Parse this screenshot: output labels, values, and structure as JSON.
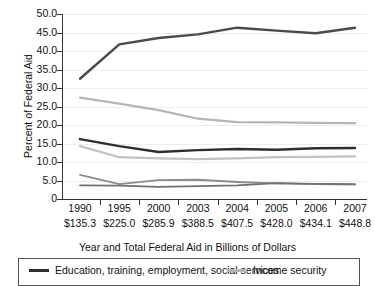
{
  "chart_data": {
    "type": "line",
    "title": "",
    "xlabel": "Year and Total Federal Aid in Billions of Dollars",
    "ylabel": "Percent of Federal Aid",
    "categories": [
      "1990",
      "1995",
      "2000",
      "2003",
      "2004",
      "2005",
      "2006",
      "2007"
    ],
    "x_sublabels": [
      "$135.3",
      "$225.0",
      "$285.9",
      "$388.5",
      "$407.5",
      "$428.0",
      "$434.1",
      "$448.8"
    ],
    "ylim": [
      0,
      50
    ],
    "yticks": [
      "0",
      "5.0",
      "10.0",
      "15.0",
      "20.0",
      "25.0",
      "30.0",
      "35.0",
      "40.0",
      "45.0",
      "50.0"
    ],
    "ytick_values": [
      0,
      5,
      10,
      15,
      20,
      25,
      30,
      35,
      40,
      45,
      50
    ],
    "grid": true,
    "legend_position": "bottom",
    "series": [
      {
        "name": "series-top-health",
        "label": "",
        "color": "#4a4a4a",
        "width": 2.4,
        "values": [
          32.5,
          41.8,
          43.5,
          44.5,
          46.3,
          45.5,
          44.8,
          46.3
        ]
      },
      {
        "name": "series-income-security",
        "label": "Income security",
        "color": "#b5b5b5",
        "width": 2.2,
        "values": [
          27.4,
          25.8,
          24.0,
          21.7,
          20.8,
          20.7,
          20.6,
          20.5
        ]
      },
      {
        "name": "series-education-training-employment-social-services",
        "label": "Education, training, employment, social services",
        "color": "#2e2e2e",
        "width": 2.4,
        "values": [
          16.2,
          14.3,
          12.7,
          13.2,
          13.5,
          13.3,
          13.7,
          13.8
        ]
      },
      {
        "name": "series-mid-light",
        "label": "",
        "color": "#c2c2c2",
        "width": 2.2,
        "values": [
          14.3,
          11.3,
          11.0,
          10.8,
          11.0,
          11.3,
          11.4,
          11.5
        ]
      },
      {
        "name": "series-lower-a",
        "label": "",
        "color": "#8c8c8c",
        "width": 1.8,
        "values": [
          6.5,
          4.0,
          5.1,
          5.2,
          4.6,
          4.2,
          4.0,
          3.9
        ]
      },
      {
        "name": "series-lower-b",
        "label": "",
        "color": "#707070",
        "width": 1.8,
        "values": [
          3.7,
          3.6,
          3.3,
          3.5,
          3.7,
          4.3,
          4.1,
          4.0
        ]
      }
    ]
  },
  "legend": {
    "items": [
      {
        "label": "Education, training, employment, social services",
        "color": "#2e2e2e"
      },
      {
        "label": "Income security",
        "color": "#b5b5b5"
      }
    ]
  }
}
